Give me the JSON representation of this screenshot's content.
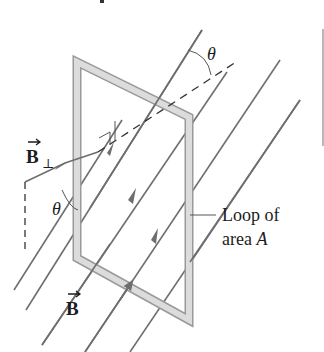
{
  "diagram": {
    "type": "physics-figure",
    "labels": {
      "b_perp_main": "B",
      "b_perp_sub": "⊥",
      "b_field": "B",
      "theta_top": "θ",
      "theta_left": "θ",
      "loop_line1": "Loop of",
      "loop_line2_prefix": "area ",
      "loop_line2_var": "A"
    },
    "colors": {
      "field_line": "#6e6e6e",
      "loop_fill": "#d9d9d9",
      "loop_edge": "#9a9a9a",
      "text": "#1c1c1c",
      "dashed": "#333333"
    },
    "elements": [
      "rectangular loop (tilted)",
      "uniform magnetic field lines B with arrows",
      "perpendicular component B⊥",
      "normal (dashed) to loop plane",
      "angle θ between B and normal",
      "right-angle marker"
    ]
  }
}
